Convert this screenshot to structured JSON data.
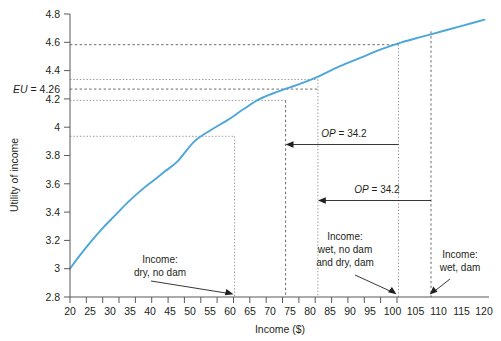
{
  "chart_data": {
    "type": "line",
    "title": "",
    "xlabel": "Income ($)",
    "ylabel": "Utility of income",
    "xlim": [
      17.5,
      122.5
    ],
    "ylim": [
      2.8,
      4.8
    ],
    "grid": false,
    "legend": "none",
    "x_ticks": [
      20,
      25,
      30,
      35,
      40,
      45,
      50,
      55,
      60,
      65,
      70,
      75,
      80,
      85,
      90,
      95,
      100,
      105,
      110,
      115,
      120
    ],
    "x_tick_labels": [
      "20",
      "25",
      "30",
      "35",
      "40",
      "45",
      "50",
      "55",
      "60",
      "65",
      "70",
      "75",
      "80",
      "85",
      "90",
      "95",
      "100",
      "105",
      "110",
      "115",
      "120"
    ],
    "y_ticks": [
      2.8,
      3.0,
      3.2,
      3.4,
      3.6,
      3.8,
      4.0,
      4.2,
      4.4,
      4.6,
      4.8
    ],
    "y_tick_labels": [
      "2.8",
      "3",
      "3.2",
      "3.4",
      "3.6",
      "3.8",
      "4",
      "4.2",
      "4.4",
      "4.6",
      "4.8"
    ],
    "series": [
      {
        "name": "Utility of income",
        "color": "#4ba7da",
        "x": [
          20,
          22,
          25,
          28,
          31,
          34,
          37,
          40,
          43,
          46,
          50,
          54,
          58,
          62,
          65.8,
          70,
          75.8,
          80,
          85,
          90,
          95,
          100,
          105,
          110,
          115,
          120
        ],
        "y": [
          3.0,
          3.08,
          3.19,
          3.29,
          3.38,
          3.47,
          3.55,
          3.62,
          3.69,
          3.76,
          3.9,
          3.98,
          4.05,
          4.13,
          4.2,
          4.25,
          4.31,
          4.36,
          4.43,
          4.49,
          4.55,
          4.6,
          4.64,
          4.68,
          4.72,
          4.76
        ]
      }
    ],
    "marked_points": [
      {
        "label": "Income: dry, no dam",
        "x": 50,
        "y": 3.9
      },
      {
        "label": "Certainty equivalent (wet, no dam)",
        "x": 65.8,
        "y": 4.2
      },
      {
        "label": "Certainty equivalent (dry, dam)",
        "x": 75.8,
        "y": 4.31
      },
      {
        "label": "Income: wet, no dam and dry, dam",
        "x": 100,
        "y": 4.6
      },
      {
        "label": "Income: wet, dam",
        "x": 110,
        "y": 4.68
      }
    ],
    "horizontal_reference_lines": [
      {
        "y": 4.6,
        "style": "dashed"
      },
      {
        "y": 4.31,
        "style": "dotted"
      },
      {
        "y": 4.26,
        "style": "dashed",
        "label": "EU = 4.26"
      },
      {
        "y": 4.2,
        "style": "dotted"
      },
      {
        "y": 3.9,
        "style": "dotted"
      }
    ],
    "vertical_reference_lines": [
      {
        "x": 50,
        "style": "dotted"
      },
      {
        "x": 65.8,
        "style": "dashed"
      },
      {
        "x": 75.8,
        "style": "dotted"
      },
      {
        "x": 100,
        "style": "dotted"
      },
      {
        "x": 110,
        "style": "dashed"
      }
    ],
    "annotations": [
      {
        "id": "op-upper",
        "text": "OP = 34.2",
        "from_x": 100,
        "to_x": 65.8,
        "at_y": 3.88,
        "value": 34.2
      },
      {
        "id": "op-lower",
        "text": "OP = 34.2",
        "from_x": 110,
        "to_x": 75.8,
        "at_y": 3.49,
        "value": 34.2
      },
      {
        "id": "callout-dry-no-dam",
        "text": "Income: dry, no dam",
        "points_to_x": 50
      },
      {
        "id": "callout-wet-no-dam-dry-dam",
        "text": "Income: wet, no dam and dry, dam",
        "points_to_x": 100
      },
      {
        "id": "callout-wet-dam",
        "text": "Income: wet, dam",
        "points_to_x": 110
      }
    ]
  },
  "axes": {
    "x_title": "Income ($)",
    "y_title": "Utility of income",
    "x_labels": [
      "20",
      "25",
      "30",
      "35",
      "40",
      "45",
      "50",
      "55",
      "60",
      "65",
      "70",
      "75",
      "80",
      "85",
      "90",
      "95",
      "100",
      "105",
      "110",
      "115",
      "120"
    ],
    "y_labels": [
      "2.8",
      "3",
      "3.2",
      "3.4",
      "3.6",
      "3.8",
      "4",
      "4.2",
      "4.4",
      "4.6",
      "4.8"
    ]
  },
  "labels": {
    "eu": "EU = 4.26",
    "eu_italic_prefix": "EU",
    "eu_rest": " = 4.26",
    "op_upper": "OP = 34.2",
    "op_lower": "OP = 34.2",
    "op_italic_prefix": "OP",
    "op_rest": " = 34.2",
    "callout_left_line1": "Income:",
    "callout_left_line2": "dry, no dam",
    "callout_mid_line1": "Income:",
    "callout_mid_line2": "wet, no dam",
    "callout_mid_line3": "and dry, dam",
    "callout_right_line1": "Income:",
    "callout_right_line2": "wet, dam"
  },
  "colors": {
    "curve": "#4ba7da",
    "axis": "#58595b",
    "text": "#231f20",
    "guide_dark": "#58595b",
    "guide_light": "#8b8d8f",
    "background": "#ffffff"
  }
}
